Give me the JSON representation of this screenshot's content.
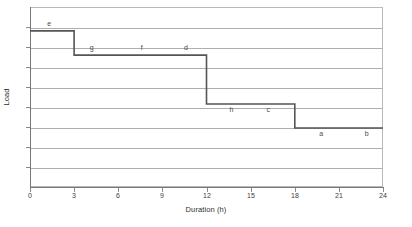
{
  "chart_data": {
    "type": "line",
    "subtype": "step-load-duration-curve",
    "title": "",
    "xlabel": "Duration (h)",
    "ylabel": "Load",
    "xlim": [
      0,
      24
    ],
    "ylim": [
      0,
      1
    ],
    "xticks": [
      0,
      3,
      6,
      9,
      12,
      15,
      18,
      21,
      24
    ],
    "xtick_labels": [
      "0",
      "3",
      "6",
      "9",
      "12",
      "15",
      "18",
      "21",
      "24"
    ],
    "yticks": [],
    "ytick_labels": [],
    "grid": "horizontal",
    "gridline_count": 8,
    "legend": "none",
    "line_color": "#555555",
    "grid_color": "#aeaeae",
    "axis_color": "#777777",
    "steps": [
      {
        "x_start": 0,
        "x_end": 3,
        "value": 0.867
      },
      {
        "x_start": 3,
        "x_end": 12,
        "value": 0.733
      },
      {
        "x_start": 12,
        "x_end": 18,
        "value": 0.461
      },
      {
        "x_start": 18,
        "x_end": 24,
        "value": 0.328
      }
    ],
    "annotations": [
      {
        "label": "e",
        "x": 1.3,
        "value": 0.867,
        "position": "above"
      },
      {
        "label": "g",
        "x": 4.2,
        "value": 0.733,
        "position": "above"
      },
      {
        "label": "f",
        "x": 7.6,
        "value": 0.733,
        "position": "above"
      },
      {
        "label": "d",
        "x": 10.6,
        "value": 0.733,
        "position": "above"
      },
      {
        "label": "h",
        "x": 13.7,
        "value": 0.461,
        "position": "below"
      },
      {
        "label": "c",
        "x": 16.2,
        "value": 0.461,
        "position": "below"
      },
      {
        "label": "a",
        "x": 19.8,
        "value": 0.328,
        "position": "below"
      },
      {
        "label": "b",
        "x": 22.9,
        "value": 0.328,
        "position": "below"
      }
    ]
  },
  "caption": ""
}
